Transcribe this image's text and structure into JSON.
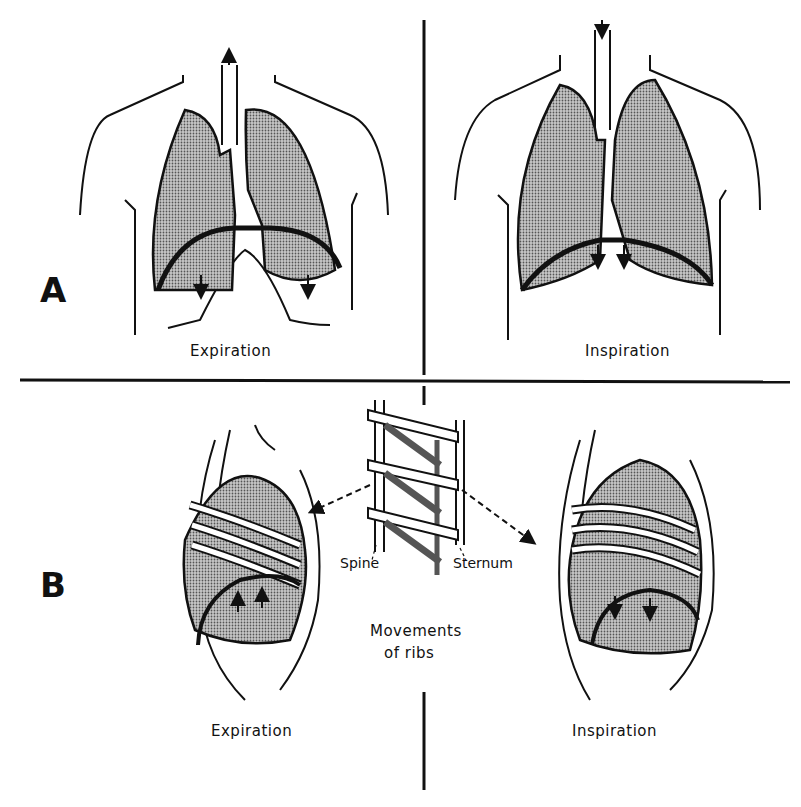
{
  "panels": {
    "A": {
      "label": "A",
      "left_caption": "Expiration",
      "right_caption": "Inspiration"
    },
    "B": {
      "label": "B",
      "left_caption": "Expiration",
      "right_caption": "Inspiration",
      "model_labels": {
        "spine": "Spine",
        "sternum": "Sternum"
      },
      "center_caption_line1": "Movements",
      "center_caption_line2": "of ribs"
    }
  },
  "colors": {
    "ink": "#111111",
    "lung_fill": "#9a9a9a",
    "background": "#ffffff"
  }
}
